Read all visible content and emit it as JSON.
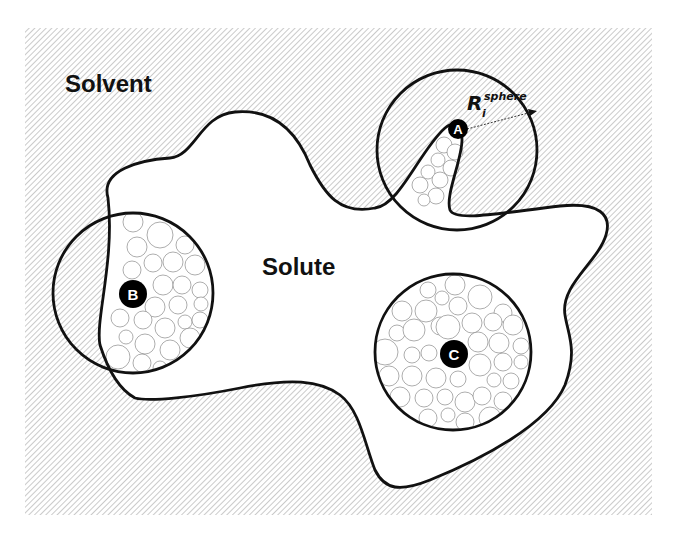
{
  "diagram": {
    "colors": {
      "background": "#ffffff",
      "hatch": "#b4b4b4",
      "outline": "#111111",
      "marker_fill": "#000000",
      "marker_text": "#ffffff",
      "packing_circle": "#8a8a8a"
    },
    "regions": {
      "solvent_label": "Solvent",
      "solute_label": "Solute"
    },
    "probe_spheres": [
      {
        "id": "A",
        "label": "A",
        "center": [
          457,
          150
        ],
        "radius": 80,
        "location": "surface protrusion"
      },
      {
        "id": "B",
        "label": "B",
        "center": [
          133,
          293
        ],
        "radius": 80,
        "location": "boundary"
      },
      {
        "id": "C",
        "label": "C",
        "center": [
          453,
          352
        ],
        "radius": 78,
        "location": "interior"
      }
    ],
    "radius_annotation": {
      "symbol": "R",
      "subscript": "i",
      "superscript": "sphere"
    }
  }
}
